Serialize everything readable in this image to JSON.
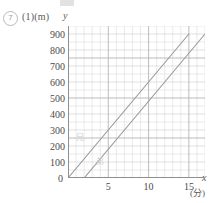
{
  "question": {
    "number_marker": "7",
    "part_label": "(1)",
    "y_unit": "(m)"
  },
  "axis": {
    "y_name": "y",
    "x_name": "x",
    "x_unit": "(分)",
    "origin_label": "0"
  },
  "annotations": {
    "upper_line_label": "兄",
    "lower_line_label": "弟"
  },
  "chart_data": {
    "type": "line",
    "title": "",
    "subtitle": "",
    "xlabel": "x",
    "ylabel": "y",
    "x_unit": "(分)",
    "y_unit": "(m)",
    "xlim": [
      0,
      17
    ],
    "ylim": [
      0,
      950
    ],
    "grid": true,
    "grid_minor_step_x": 1,
    "grid_minor_step_y": 50,
    "grid_major_step_x": 5,
    "grid_major_step_y": 250,
    "xticks": [
      5,
      10,
      15
    ],
    "xtick_labels": [
      "5",
      "10",
      "15"
    ],
    "yticks": [
      0,
      100,
      200,
      300,
      400,
      500,
      600,
      700,
      800,
      900
    ],
    "ytick_labels": [
      "0",
      "100",
      "200",
      "300",
      "400",
      "500",
      "600",
      "700",
      "800",
      "900"
    ],
    "legend": "none",
    "series": [
      {
        "name": "兄",
        "points": [
          [
            0,
            0
          ],
          [
            15,
            900
          ]
        ],
        "slope": 60,
        "intercept": 0,
        "color": "#9a9a9a"
      },
      {
        "name": "弟",
        "points": [
          [
            2,
            0
          ],
          [
            17,
            900
          ]
        ],
        "slope": 60,
        "intercept": -120,
        "color": "#9a9a9a"
      }
    ]
  }
}
